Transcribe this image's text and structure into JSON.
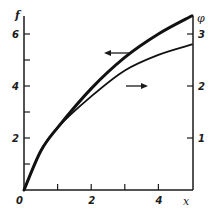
{
  "chart_data": {
    "type": "line",
    "title": "",
    "xlabel": "x",
    "ylabel_left": "f",
    "ylabel_right": "φ",
    "origin_label": "0",
    "xlim": [
      0,
      5
    ],
    "ylim_left": [
      0,
      6.8
    ],
    "ylim_right": [
      0,
      3.4
    ],
    "x_ticks": [
      1,
      2,
      3,
      4
    ],
    "x_tick_labels": [
      "",
      "2",
      "",
      "4"
    ],
    "left_ticks": [
      1,
      2,
      3,
      4,
      5,
      6
    ],
    "left_tick_labels": [
      "",
      "2",
      "",
      "4",
      "",
      "6"
    ],
    "right_ticks": [
      1,
      2,
      3
    ],
    "right_tick_labels": [
      "1",
      "2",
      "3"
    ],
    "grid": false,
    "legend": "none; arrows indicate axis for each curve",
    "series": [
      {
        "name": "f (left axis)",
        "axis": "left",
        "style": "thick",
        "x": [
          0,
          0.5,
          1,
          2,
          3,
          4,
          5
        ],
        "values": [
          0,
          1.5,
          2.4,
          3.9,
          5.1,
          6.0,
          6.7
        ],
        "annotation": "arrow pointing left"
      },
      {
        "name": "φ (right axis)",
        "axis": "right",
        "style": "thin",
        "x": [
          0,
          0.5,
          1,
          2,
          3,
          4,
          5
        ],
        "values": [
          0,
          0.75,
          1.2,
          1.8,
          2.3,
          2.6,
          2.8
        ],
        "annotation": "arrow pointing right"
      }
    ]
  }
}
